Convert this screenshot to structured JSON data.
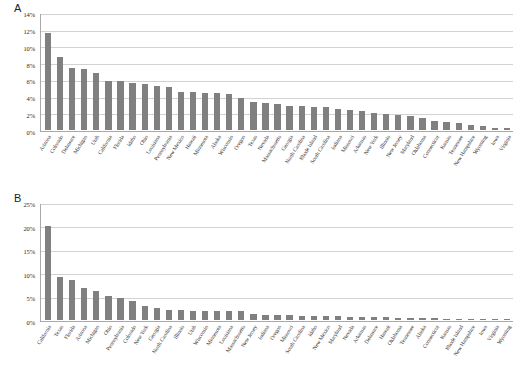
{
  "figure": {
    "background": "#ffffff",
    "bar_color": "#808080",
    "axis_color": "#a9a9a9",
    "grid_color": "#d2d2d2"
  },
  "panels": [
    {
      "label": "A",
      "ytick_labels": [
        "0%",
        "2%",
        "4%",
        "6%",
        "8%",
        "10%",
        "12%",
        "14%"
      ]
    },
    {
      "label": "B",
      "ytick_labels": [
        "0%",
        "5%",
        "10%",
        "15%",
        "20%",
        "25%"
      ]
    }
  ],
  "chart_data": [
    {
      "type": "bar",
      "title": "A",
      "xlabel": "",
      "ylabel": "",
      "ylim": [
        0,
        14
      ],
      "yticks": [
        0,
        2,
        4,
        6,
        8,
        10,
        12,
        14
      ],
      "ytick_labels": [
        "0%",
        "2%",
        "4%",
        "6%",
        "8%",
        "10%",
        "12%",
        "14%"
      ],
      "grid": true,
      "legend": "none",
      "categories": [
        "Arizona",
        "Colorado",
        "Delaware",
        "Michigan",
        "Utah",
        "California",
        "Florida",
        "Idaho",
        "Ohio",
        "Louisiana",
        "Pennsylvania",
        "New Mexico",
        "Hawaii",
        "Minnesota",
        "Alaska",
        "Wisconsin",
        "Oregon",
        "Texas",
        "Nevada",
        "Massachusetts",
        "Georgia",
        "North Carolina",
        "Rhode Island",
        "South Carolina",
        "Indiana",
        "Missouri",
        "Arkansas",
        "New York",
        "Illinois",
        "New Jersey",
        "Maryland",
        "Oklahoma",
        "Connecticut",
        "Kansas",
        "Tennessee",
        "New Hampshire",
        "Wyoming",
        "Iowa",
        "Virginia"
      ],
      "values": [
        11.6,
        8.7,
        7.4,
        7.3,
        6.8,
        5.9,
        5.9,
        5.6,
        5.5,
        5.3,
        5.2,
        4.6,
        4.6,
        4.4,
        4.4,
        4.3,
        3.8,
        3.3,
        3.2,
        3.1,
        2.9,
        2.9,
        2.8,
        2.7,
        2.5,
        2.4,
        2.3,
        2.0,
        1.9,
        1.8,
        1.7,
        1.4,
        1.1,
        1.0,
        0.8,
        0.6,
        0.5,
        0.3,
        0.2
      ]
    },
    {
      "type": "bar",
      "title": "B",
      "xlabel": "",
      "ylabel": "",
      "ylim": [
        0,
        25
      ],
      "yticks": [
        0,
        5,
        10,
        15,
        20,
        25
      ],
      "ytick_labels": [
        "0%",
        "5%",
        "10%",
        "15%",
        "20%",
        "25%"
      ],
      "grid": true,
      "legend": "none",
      "categories": [
        "California",
        "Texas",
        "Florida",
        "Arizona",
        "Michigan",
        "Ohio",
        "Pennsylvania",
        "Colorado",
        "New York",
        "Georgia",
        "North Carolina",
        "Illinois",
        "Utah",
        "Wisconsin",
        "Minnesota",
        "Louisiana",
        "Massachusetts",
        "New Jersey",
        "Indiana",
        "Oregon",
        "Missouri",
        "South Carolina",
        "Idaho",
        "New Mexico",
        "Maryland",
        "Nevada",
        "Arkansas",
        "Delaware",
        "Hawaii",
        "Oklahoma",
        "Tennessee",
        "Alaska",
        "Connecticut",
        "Kansas",
        "Rhode Island",
        "New Hampshire",
        "Iowa",
        "Virginia",
        "Wyoming"
      ],
      "values": [
        20.1,
        9.2,
        8.5,
        6.8,
        6.2,
        5.2,
        4.8,
        4.1,
        3.0,
        2.5,
        2.2,
        2.1,
        1.9,
        1.9,
        1.9,
        1.9,
        1.9,
        1.2,
        1.0,
        1.0,
        1.0,
        0.9,
        0.9,
        0.8,
        0.8,
        0.7,
        0.7,
        0.6,
        0.6,
        0.5,
        0.5,
        0.4,
        0.4,
        0.3,
        0.3,
        0.3,
        0.2,
        0.2,
        0.1
      ]
    }
  ]
}
